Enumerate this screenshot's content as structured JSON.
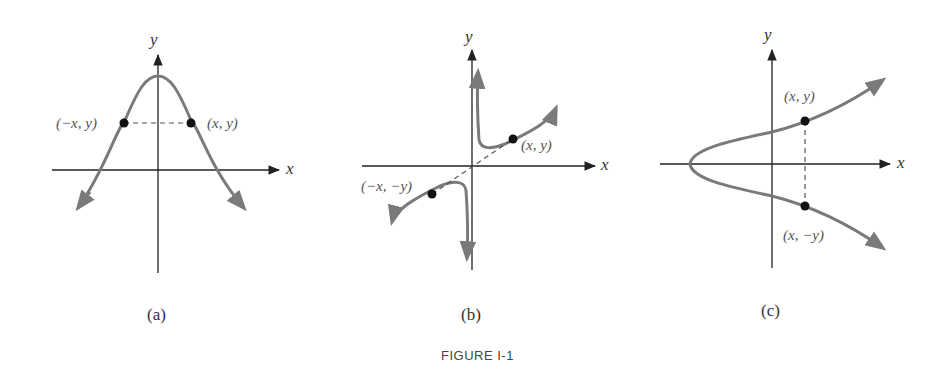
{
  "figure": {
    "title": "FIGURE I-1",
    "colors": {
      "axis": "#222222",
      "curve": "#7a7a7a",
      "point": "#111111",
      "dash": "#555555"
    },
    "panels": [
      {
        "id": "a",
        "caption": "(a)",
        "x_axis_label": "x",
        "y_axis_label": "y",
        "symmetry": "symmetric with respect to the y-axis",
        "points": [
          {
            "label": "(−x, y)"
          },
          {
            "label": "(x, y)"
          }
        ]
      },
      {
        "id": "b",
        "caption": "(b)",
        "x_axis_label": "x",
        "y_axis_label": "y",
        "symmetry": "symmetric with respect to the origin",
        "points": [
          {
            "label": "(x, y)"
          },
          {
            "label": "(−x, −y)"
          }
        ]
      },
      {
        "id": "c",
        "caption": "(c)",
        "x_axis_label": "x",
        "y_axis_label": "y",
        "symmetry": "symmetric with respect to the x-axis",
        "points": [
          {
            "label": "(x, y)"
          },
          {
            "label": "(x, −y)"
          }
        ]
      }
    ]
  }
}
